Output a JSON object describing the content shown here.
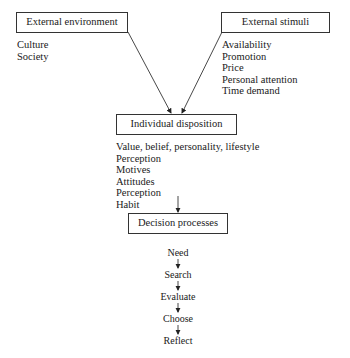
{
  "nodes": {
    "external_environment": {
      "label": "External environment",
      "items": [
        "Culture",
        "Society"
      ]
    },
    "external_stimuli": {
      "label": "External stimuli",
      "items": [
        "Availability",
        "Promotion",
        "Price",
        "Personal attention",
        "Time demand"
      ]
    },
    "individual_disposition": {
      "label": "Individual disposition",
      "items": [
        "Value, belief, personality, lifestyle",
        "Perception",
        "Motives",
        "Attitudes",
        "Perception",
        "Habit"
      ]
    },
    "decision_processes": {
      "label": "Decision processes",
      "steps": [
        "Need",
        "Search",
        "Evaluate",
        "Choose",
        "Reflect"
      ]
    }
  }
}
